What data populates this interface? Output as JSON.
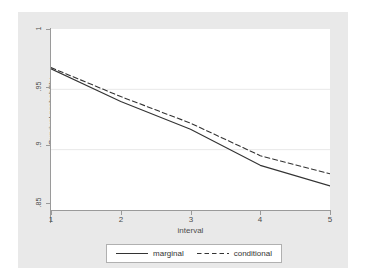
{
  "chart_data": {
    "type": "line",
    "title": "",
    "xlabel": "interval",
    "ylabel": "Survival probability",
    "x": [
      1,
      2,
      3,
      4,
      5
    ],
    "xlim": [
      1,
      5
    ],
    "ylim": [
      0.85,
      1
    ],
    "xticks": [
      "1",
      "2",
      "3",
      "4",
      "5"
    ],
    "yticks": [
      ".85",
      ".9",
      ".95",
      "1"
    ],
    "ytick_values": [
      0.85,
      0.9,
      0.95,
      1
    ],
    "grid": true,
    "grid_axis": "y",
    "legend_position": "bottom-center",
    "series": [
      {
        "name": "marginal",
        "style": "solid",
        "color": "#333333",
        "values": [
          0.967,
          0.94,
          0.917,
          0.887,
          0.87
        ]
      },
      {
        "name": "conditional",
        "style": "dashed",
        "color": "#333333",
        "values": [
          0.968,
          0.944,
          0.922,
          0.895,
          0.88
        ]
      }
    ]
  },
  "legend": {
    "entries": [
      {
        "label": "marginal",
        "icon": "solid-line-icon"
      },
      {
        "label": "conditional",
        "icon": "dashed-line-icon"
      }
    ]
  },
  "colors": {
    "graph_region": "#e9e9e9",
    "plot_area": "#ffffff",
    "axis": "#9a9a9a",
    "gridline": "#e8e8e8",
    "text": "#4d4d4d",
    "series": "#333333"
  }
}
